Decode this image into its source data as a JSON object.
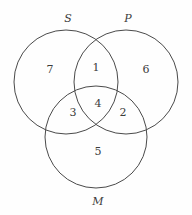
{
  "diagram": {
    "type": "venn-3-set",
    "background_color": "#fefefe",
    "stroke_color": "#4a4a4a",
    "text_color": "#3c3c3c",
    "sets": [
      {
        "key": "S",
        "label": "S",
        "label_x": 68,
        "label_y": 18,
        "cx": 66,
        "cy": 82,
        "r": 52
      },
      {
        "key": "P",
        "label": "P",
        "label_x": 128,
        "label_y": 18,
        "cx": 126,
        "cy": 82,
        "r": 52
      },
      {
        "key": "M",
        "label": "M",
        "label_x": 98,
        "label_y": 201,
        "cx": 96,
        "cy": 137,
        "r": 51
      }
    ],
    "regions": [
      {
        "id": "region-1",
        "label": "1",
        "x": 96,
        "y": 67,
        "membership": "S and P, not M"
      },
      {
        "id": "region-2",
        "label": "2",
        "x": 123,
        "y": 112,
        "membership": "P and M, not S"
      },
      {
        "id": "region-3",
        "label": "3",
        "x": 73,
        "y": 112,
        "membership": "S and M, not P"
      },
      {
        "id": "region-4",
        "label": "4",
        "x": 98,
        "y": 103,
        "membership": "S and P and M"
      },
      {
        "id": "region-5",
        "label": "5",
        "x": 98,
        "y": 151,
        "membership": "M only"
      },
      {
        "id": "region-6",
        "label": "6",
        "x": 146,
        "y": 69,
        "membership": "P only"
      },
      {
        "id": "region-7",
        "label": "7",
        "x": 50,
        "y": 69,
        "membership": "S only"
      }
    ]
  }
}
